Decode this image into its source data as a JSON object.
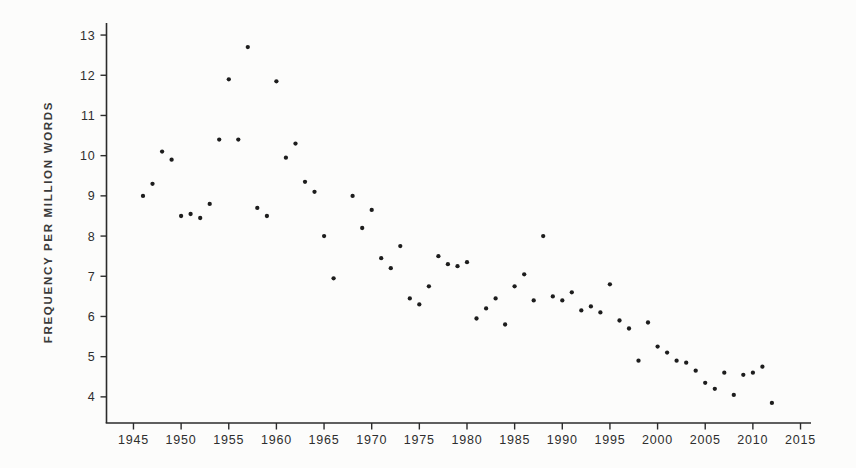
{
  "page": {
    "background_color": "#fcfcfb"
  },
  "chart_data": {
    "type": "scatter",
    "title": "",
    "xlabel": "",
    "ylabel": "FREQUENCY PER MILLION WORDS",
    "legend": null,
    "grid": false,
    "axis_color": "#2b2b2b",
    "tick_label_color": "#2e2e2e",
    "marker": {
      "shape": "circle",
      "color": "#1d1d1d",
      "radius_px": 2.15
    },
    "x_ticks": [
      1945,
      1950,
      1955,
      1960,
      1965,
      1970,
      1975,
      1980,
      1985,
      1990,
      1995,
      2000,
      2005,
      2010,
      2015
    ],
    "y_ticks": [
      4,
      5,
      6,
      7,
      8,
      9,
      10,
      11,
      12,
      13
    ],
    "xlim": [
      1942.17,
      2016.1
    ],
    "ylim": [
      3.35,
      13.3
    ],
    "points": [
      [
        1946,
        9.0
      ],
      [
        1947,
        9.3
      ],
      [
        1948,
        10.1
      ],
      [
        1949,
        9.9
      ],
      [
        1950,
        8.5
      ],
      [
        1951,
        8.55
      ],
      [
        1952,
        8.45
      ],
      [
        1953,
        8.8
      ],
      [
        1954,
        10.4
      ],
      [
        1955,
        11.9
      ],
      [
        1956,
        10.4
      ],
      [
        1957,
        12.7
      ],
      [
        1958,
        8.7
      ],
      [
        1959,
        8.5
      ],
      [
        1960,
        11.85
      ],
      [
        1961,
        9.95
      ],
      [
        1962,
        10.3
      ],
      [
        1963,
        9.35
      ],
      [
        1964,
        9.1
      ],
      [
        1965,
        8.0
      ],
      [
        1966,
        6.95
      ],
      [
        1968,
        9.0
      ],
      [
        1969,
        8.2
      ],
      [
        1970,
        8.65
      ],
      [
        1971,
        7.45
      ],
      [
        1972,
        7.2
      ],
      [
        1973,
        7.75
      ],
      [
        1974,
        6.45
      ],
      [
        1975,
        6.3
      ],
      [
        1976,
        6.75
      ],
      [
        1977,
        7.5
      ],
      [
        1978,
        7.3
      ],
      [
        1979,
        7.25
      ],
      [
        1980,
        7.35
      ],
      [
        1981,
        5.95
      ],
      [
        1982,
        6.2
      ],
      [
        1983,
        6.45
      ],
      [
        1984,
        5.8
      ],
      [
        1985,
        6.75
      ],
      [
        1986,
        7.05
      ],
      [
        1987,
        6.4
      ],
      [
        1988,
        8.0
      ],
      [
        1989,
        6.5
      ],
      [
        1990,
        6.4
      ],
      [
        1991,
        6.6
      ],
      [
        1992,
        6.15
      ],
      [
        1993,
        6.25
      ],
      [
        1994,
        6.1
      ],
      [
        1995,
        6.8
      ],
      [
        1996,
        5.9
      ],
      [
        1997,
        5.7
      ],
      [
        1998,
        4.9
      ],
      [
        1999,
        5.85
      ],
      [
        2000,
        5.25
      ],
      [
        2001,
        5.1
      ],
      [
        2002,
        4.9
      ],
      [
        2003,
        4.85
      ],
      [
        2004,
        4.65
      ],
      [
        2005,
        4.35
      ],
      [
        2006,
        4.2
      ],
      [
        2007,
        4.6
      ],
      [
        2008,
        4.05
      ],
      [
        2009,
        4.55
      ],
      [
        2010,
        4.6
      ],
      [
        2011,
        4.75
      ],
      [
        2012,
        3.85
      ]
    ]
  }
}
